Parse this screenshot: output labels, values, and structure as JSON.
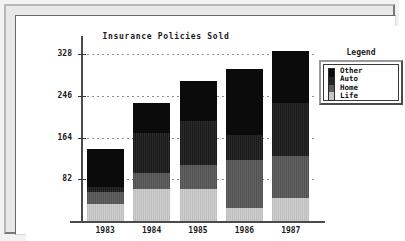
{
  "window": {
    "frame_style": "beveled-3d",
    "background": "#ffffff"
  },
  "chart_data": {
    "type": "bar",
    "stacked": true,
    "title": "Insurance Policies Sold",
    "xlabel": "",
    "ylabel": "",
    "categories": [
      "1983",
      "1984",
      "1985",
      "1986",
      "1987"
    ],
    "ytick_labels": [
      "328",
      "246",
      "164",
      "82"
    ],
    "ytick_values": [
      328,
      246,
      164,
      82
    ],
    "ylim": [
      0,
      360
    ],
    "grid": true,
    "grid_style": "dotted-horizontal",
    "legend_position": "right",
    "legend_title": "Legend",
    "series": [
      {
        "name": "Life",
        "color": "#c6c6c6",
        "values": [
          33,
          62,
          62,
          25,
          46
        ]
      },
      {
        "name": "Home",
        "color": "#5a5a5a",
        "values": [
          24,
          33,
          48,
          95,
          82
        ]
      },
      {
        "name": "Auto",
        "color": "#242424",
        "values": [
          9,
          79,
          86,
          49,
          104
        ]
      },
      {
        "name": "Other",
        "color": "#0b0b0b",
        "values": [
          76,
          59,
          79,
          130,
          103
        ]
      }
    ],
    "totals": [
      142,
      233,
      275,
      299,
      335
    ]
  },
  "legend": {
    "title": "Legend",
    "entries": [
      {
        "label": "Other",
        "color": "#0b0b0b"
      },
      {
        "label": "Auto",
        "color": "#242424"
      },
      {
        "label": "Home",
        "color": "#5a5a5a"
      },
      {
        "label": "Life",
        "color": "#c6c6c6"
      }
    ]
  }
}
